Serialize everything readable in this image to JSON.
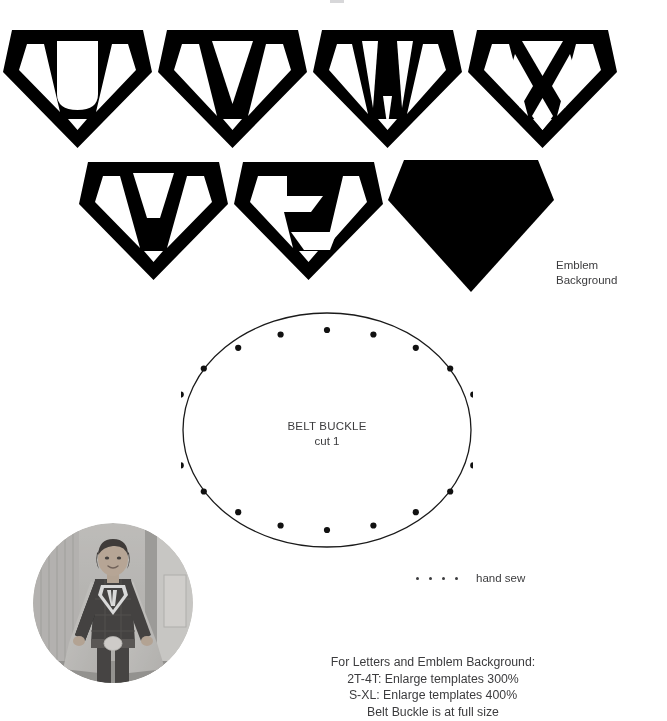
{
  "document": {
    "title": "Superhero Cape Pattern Templates"
  },
  "emblems": {
    "row1": [
      {
        "letter": "U",
        "name": "emblem-letter-u"
      },
      {
        "letter": "V",
        "name": "emblem-letter-v"
      },
      {
        "letter": "W",
        "name": "emblem-letter-w"
      },
      {
        "letter": "X",
        "name": "emblem-letter-x"
      }
    ],
    "row2": [
      {
        "letter": "Y",
        "name": "emblem-letter-y"
      },
      {
        "letter": "Z",
        "name": "emblem-letter-z"
      }
    ],
    "background": {
      "label": "Emblem\nBackground",
      "fill": "#000000"
    }
  },
  "belt_buckle": {
    "title": "BELT BUCKLE",
    "cut_instruction": "cut 1",
    "dot_count": 16,
    "outline_color": "#1a1a1a",
    "dot_color": "#111111"
  },
  "legend": {
    "dot_count": 4,
    "label": "hand sew"
  },
  "photo": {
    "alt": "Child wearing handmade superhero costume with W emblem, cape and belt buckle"
  },
  "instructions": {
    "text": "For Letters and Emblem Background:\n2T-4T: Enlarge templates 300%\nS-XL: Enlarge templates 400%\nBelt Buckle is at full size"
  },
  "colors": {
    "ink": "#3c3c3e",
    "line": "#1a1a1a",
    "solid": "#000000",
    "page": "#ffffff"
  }
}
